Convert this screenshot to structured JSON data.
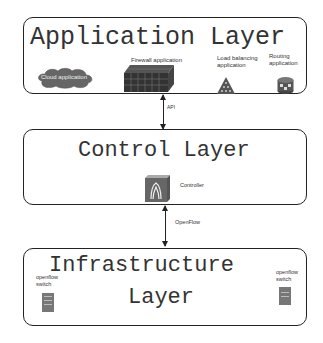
{
  "application_layer": {
    "title": "Application Layer",
    "items": [
      {
        "label": "Cloud application",
        "icon": "cloud-icon"
      },
      {
        "label": "Firewall application",
        "icon": "firewall-icon"
      },
      {
        "label": "Load balancing\napplication",
        "icon": "load-balancer-icon"
      },
      {
        "label": "Routing\napplication",
        "icon": "router-icon"
      }
    ]
  },
  "api_link": {
    "label": "API"
  },
  "control_layer": {
    "title": "Control Layer",
    "controller": {
      "label": "Controller",
      "icon": "controller-icon"
    }
  },
  "openflow_link": {
    "label": "OpenFlow"
  },
  "infrastructure_layer": {
    "title_line1": "Infrastructure",
    "title_line2": "Layer",
    "switches": [
      {
        "label": "openflow\nswitch",
        "icon": "switch-icon"
      },
      {
        "label": "openflow\nswitch",
        "icon": "switch-icon"
      }
    ]
  },
  "colors": {
    "border": "#222222",
    "icon_gray": "#555555",
    "icon_dark": "#333333"
  }
}
